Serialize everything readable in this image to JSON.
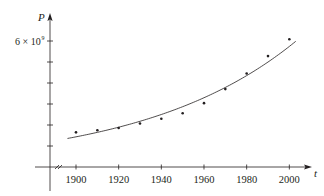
{
  "chart_data": {
    "type": "scatter",
    "title": "",
    "xlabel": "t",
    "ylabel": "P",
    "x_ticks": [
      1900,
      1920,
      1940,
      1960,
      1980,
      2000
    ],
    "x_tick_labels": [
      "1900",
      "1920",
      "1940",
      "1960",
      "1980",
      "2000"
    ],
    "y_ticks": [
      1000000000.0,
      2000000000.0,
      3000000000.0,
      4000000000.0,
      5000000000.0,
      6000000000.0
    ],
    "y_tick_labels": [
      "",
      "",
      "",
      "",
      "",
      "6 × 10⁹"
    ],
    "y_label_text": "6 × 10",
    "y_label_exp": "9",
    "xlim": [
      1885,
      2012
    ],
    "ylim": [
      0,
      6600000000.0
    ],
    "grid": false,
    "axis_break": true,
    "series": [
      {
        "name": "data",
        "kind": "points",
        "x": [
          1900,
          1910,
          1920,
          1930,
          1940,
          1950,
          1960,
          1970,
          1980,
          1990,
          2000
        ],
        "values": [
          1650000000.0,
          1750000000.0,
          1860000000.0,
          2070000000.0,
          2300000000.0,
          2560000000.0,
          3040000000.0,
          3710000000.0,
          4450000000.0,
          5280000000.0,
          6080000000.0
        ]
      },
      {
        "name": "exponential model",
        "kind": "curve",
        "x_range": [
          1896,
          2003
        ],
        "formula": "P = 1.43653e9 * 1.01395^(t-1900)"
      }
    ],
    "colors": {
      "axis": "#231f20",
      "points": "#231f20",
      "curve": "#231f20"
    }
  }
}
